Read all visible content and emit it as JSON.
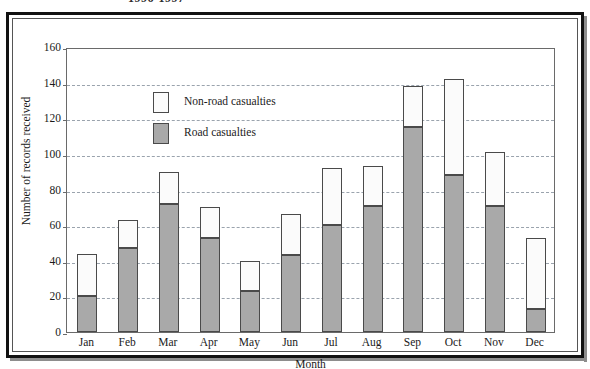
{
  "top_caption": "1996-1997",
  "chart_data": {
    "type": "bar",
    "subtype": "stacked",
    "title": "",
    "xlabel": "Month",
    "ylabel": "Number of records received",
    "categories": [
      "Jan",
      "Feb",
      "Mar",
      "Apr",
      "May",
      "Jun",
      "Jul",
      "Aug",
      "Sep",
      "Oct",
      "Nov",
      "Dec"
    ],
    "series": [
      {
        "name": "Road casualties",
        "color": "#a9a9a9",
        "values": [
          20,
          47,
          72,
          53,
          23,
          43,
          60,
          71,
          115,
          88,
          71,
          13
        ]
      },
      {
        "name": "Non-road casualties",
        "color": "#fbfbfb",
        "values": [
          24,
          16,
          18,
          17,
          17,
          23,
          32,
          22,
          23,
          54,
          30,
          40
        ]
      }
    ],
    "totals": [
      44,
      63,
      90,
      70,
      40,
      66,
      92,
      93,
      138,
      142,
      101,
      53
    ],
    "ylim": [
      0,
      160
    ],
    "yticks": [
      0,
      20,
      40,
      60,
      80,
      100,
      120,
      140,
      160
    ],
    "ytick_labels": [
      "0",
      "20",
      "40",
      "60",
      "80",
      "100",
      "120",
      "140",
      "160"
    ],
    "grid": true,
    "grid_axis": "y",
    "grid_style": "dashed",
    "legend_position": "upper left inside plot",
    "legend": [
      "Non-road casualties",
      "Road casualties"
    ]
  },
  "legend": {
    "items": [
      {
        "label": "Non-road casualties",
        "swatch": "white-square-swatch"
      },
      {
        "label": "Road casualties",
        "swatch": "gray-square-swatch"
      }
    ]
  },
  "colors": {
    "road_bar": "#a9a9a9",
    "nonroad_bar": "#fbfbfb",
    "bar_outline": "#4a4a4a",
    "gridline": "#9aa3ad",
    "axis": "#6a6a6a",
    "frame": "#111111",
    "text": "#1a1a1a"
  }
}
